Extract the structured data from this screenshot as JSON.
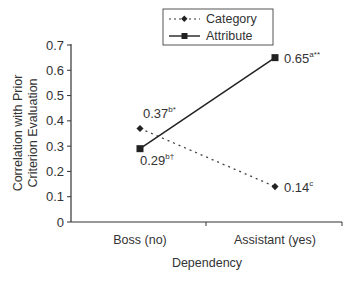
{
  "chart_data": {
    "type": "line",
    "title": "",
    "xlabel": "Dependency",
    "ylabel": "Correlation with Prior Criterion Evaluation",
    "ylabel_lines": [
      "Correlation with Prior",
      "Criterion Evaluation"
    ],
    "categories": [
      "Boss (no)",
      "Assistant (yes)"
    ],
    "ylim": [
      0,
      0.7
    ],
    "yticks": [
      "0",
      "0.1",
      "0.2",
      "0.3",
      "0.4",
      "0.5",
      "0.6",
      "0.7"
    ],
    "grid": false,
    "legend_position": "top-center",
    "series": [
      {
        "name": "Category",
        "style": "dotted-diamond",
        "values": [
          0.37,
          0.14
        ],
        "labels": [
          {
            "text": "0.37",
            "sup": "b*"
          },
          {
            "text": "0.14",
            "sup": "c"
          }
        ]
      },
      {
        "name": "Attribute",
        "style": "solid-square",
        "values": [
          0.29,
          0.65
        ],
        "labels": [
          {
            "text": "0.29",
            "sup": "b†"
          },
          {
            "text": "0.65",
            "sup": "a**"
          }
        ]
      }
    ]
  }
}
